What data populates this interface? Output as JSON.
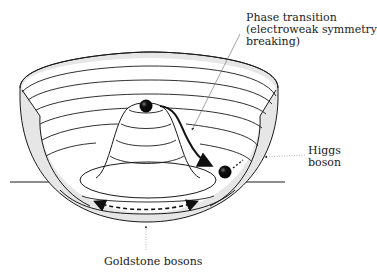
{
  "diagram": {
    "labels": {
      "phase_transition": {
        "line1": "Phase transition",
        "line2": "(electroweak symmetry",
        "line3": "breaking)"
      },
      "higgs_boson": {
        "line1": "Higgs",
        "line2": "boson"
      },
      "goldstone_bosons": {
        "line1": "Goldstone bosons"
      }
    },
    "colors": {
      "line": "#1a1a1a",
      "bowl_shading": "#e6e6e6",
      "ball": "#111111",
      "leader": "#666666",
      "background": "#ffffff"
    }
  }
}
